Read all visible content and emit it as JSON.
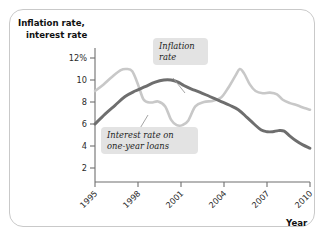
{
  "figure": {
    "frame_color": "#c9c9c9",
    "background": "#ffffff"
  },
  "axes": {
    "y_title_line1": "Inflation rate,",
    "y_title_line2": "interest rate",
    "x_title": "Year",
    "y_ticks": [
      "12%",
      "10",
      "8",
      "6",
      "4",
      "2"
    ],
    "x_ticks": [
      "1995",
      "1998",
      "2001",
      "2004",
      "2007",
      "2010"
    ]
  },
  "annotations": {
    "inflation_label_line1": "Inflation",
    "inflation_label_line2": "rate",
    "interest_label_line1": "Interest rate on",
    "interest_label_line2": "one-year loans"
  },
  "chart_data": {
    "type": "line",
    "title": "",
    "xlabel": "Year",
    "ylabel": "Inflation rate, interest rate",
    "xlim": [
      1995,
      2010
    ],
    "ylim": [
      0,
      13
    ],
    "ytick_values": [
      12,
      10,
      8,
      6,
      4,
      2
    ],
    "ytick_labels": [
      "12%",
      "10",
      "8",
      "6",
      "4",
      "2"
    ],
    "xtick_values": [
      1995,
      1998,
      2001,
      2004,
      2007,
      2010
    ],
    "grid": false,
    "legend": "inline-callouts",
    "series": [
      {
        "name": "Inflation rate",
        "color": "#c8c8c8",
        "stroke_width": 2.6,
        "x": [
          1995.0,
          1995.6,
          1996.2,
          1996.8,
          1997.2,
          1997.6,
          1998.0,
          1998.4,
          1998.9,
          1999.4,
          1999.9,
          2000.3,
          2000.7,
          2001.1,
          2001.5,
          2002.0,
          2002.6,
          2003.2,
          2003.8,
          2004.3,
          2004.8,
          2005.1,
          2005.4,
          2005.8,
          2006.2,
          2006.7,
          2007.2,
          2007.7,
          2008.1,
          2008.6,
          2009.1,
          2009.6,
          2010.0
        ],
        "y": [
          9.0,
          9.6,
          10.3,
          10.9,
          11.0,
          10.8,
          9.6,
          8.2,
          7.95,
          8.05,
          7.6,
          6.4,
          5.9,
          5.9,
          6.3,
          7.6,
          8.0,
          8.1,
          8.4,
          9.3,
          10.4,
          11.0,
          10.6,
          9.6,
          9.0,
          8.8,
          8.85,
          8.7,
          8.2,
          7.9,
          7.7,
          7.45,
          7.3
        ]
      },
      {
        "name": "Interest rate on one-year loans",
        "color": "#6e6e6e",
        "stroke_width": 2.9,
        "x": [
          1995.0,
          1995.7,
          1996.4,
          1997.1,
          1997.8,
          1998.5,
          1999.2,
          1999.8,
          2000.3,
          2000.8,
          2001.2,
          2001.7,
          2002.3,
          2003.0,
          2003.7,
          2004.4,
          2005.0,
          2005.6,
          2006.1,
          2006.6,
          2007.0,
          2007.4,
          2007.8,
          2008.2,
          2008.6,
          2009.0,
          2009.5,
          2010.0
        ],
        "y": [
          6.0,
          6.9,
          7.7,
          8.5,
          9.0,
          9.4,
          9.8,
          10.0,
          10.0,
          9.8,
          9.5,
          9.2,
          8.9,
          8.5,
          8.1,
          7.7,
          7.3,
          6.6,
          6.0,
          5.45,
          5.3,
          5.3,
          5.4,
          5.35,
          4.9,
          4.5,
          4.1,
          3.8
        ]
      }
    ]
  }
}
